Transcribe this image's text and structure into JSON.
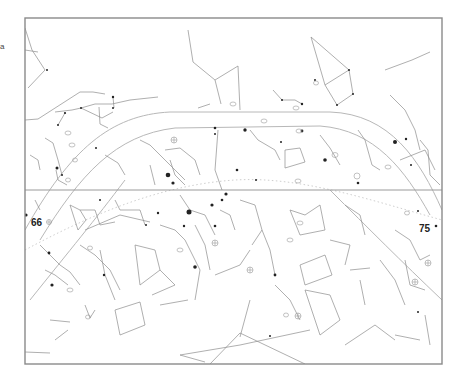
{
  "chart": {
    "frame": {
      "x": 25,
      "y": 18,
      "width": 417,
      "height": 346
    },
    "equator_y": 190,
    "colors": {
      "frame": "#8a8a8a",
      "lines": "#8c8c8c",
      "stars": "#222222",
      "background": "#ffffff"
    }
  },
  "labels": {
    "left_number": "66",
    "right_number": "75",
    "edge_mark": "a"
  }
}
